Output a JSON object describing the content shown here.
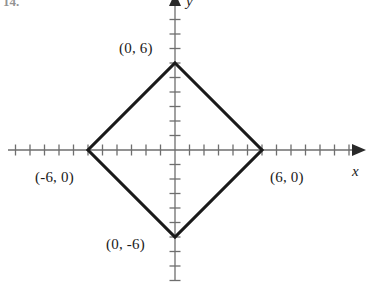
{
  "figure": {
    "item_number": "14.",
    "background_color": "#ffffff",
    "axis_color": "#6e6e6e",
    "curve_color": "#1a1a1a",
    "label_color": "#1a1a1a"
  },
  "axes": {
    "x_label": "x",
    "y_label": "y",
    "origin_px": {
      "x": 175,
      "y": 150
    },
    "tick_spacing_px": 14.5,
    "x_ticks_left": 11,
    "x_ticks_right": 12,
    "y_ticks_up": 9,
    "y_ticks_down": 9,
    "arrow_x": "right",
    "arrow_y": "up"
  },
  "labels": {
    "top_vertex": "(0, 6)",
    "left_vertex": "(-6, 0)",
    "right_vertex": "(6, 0)",
    "bottom_vertex": "(0, -6)"
  },
  "chart_data": {
    "type": "line",
    "title": "",
    "xlabel": "x",
    "ylabel": "y",
    "grid": false,
    "legend": "none",
    "xlim": [
      -12,
      13
    ],
    "ylim": [
      -9,
      9
    ],
    "xticks": [
      -11,
      -10,
      -9,
      -8,
      -7,
      -6,
      -5,
      -4,
      -3,
      -2,
      -1,
      0,
      1,
      2,
      3,
      4,
      5,
      6,
      7,
      8,
      9,
      10,
      11,
      12
    ],
    "yticks": [
      -9,
      -8,
      -7,
      -6,
      -5,
      -4,
      -3,
      -2,
      -1,
      0,
      1,
      2,
      3,
      4,
      5,
      6,
      7,
      8,
      9
    ],
    "tick_labels_shown": false,
    "series": [
      {
        "name": "|x| + |y| = 6",
        "closed": true,
        "x": [
          0,
          6,
          0,
          -6
        ],
        "y": [
          6,
          0,
          -6,
          0
        ],
        "annotations": [
          "(0, 6)",
          "(6, 0)",
          "(0, -6)",
          "(-6, 0)"
        ]
      }
    ]
  }
}
